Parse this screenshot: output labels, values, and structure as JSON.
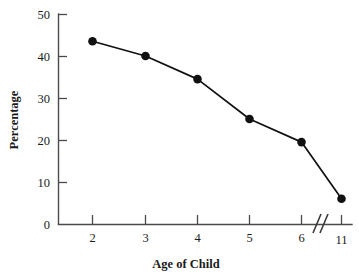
{
  "chart_data": {
    "type": "line",
    "title": "",
    "xlabel": "Age of Child",
    "ylabel": "Percentage",
    "x": [
      2,
      3,
      4,
      5,
      6,
      11
    ],
    "values": [
      43.5,
      40.0,
      34.5,
      25.0,
      19.5,
      6.0
    ],
    "series": [
      {
        "name": "Percentage",
        "values": [
          43.5,
          40.0,
          34.5,
          25.0,
          19.5,
          6.0
        ]
      }
    ],
    "categories": [
      "2",
      "3",
      "4",
      "5",
      "6",
      "11"
    ],
    "x_tick_labels": [
      "2",
      "3",
      "4",
      "5",
      "6",
      "11"
    ],
    "y_tick_labels": [
      "0",
      "10",
      "20",
      "30",
      "40",
      "50"
    ],
    "y_ticks": [
      0,
      10,
      20,
      30,
      40,
      50
    ],
    "ylim": [
      0,
      50
    ],
    "grid": false,
    "legend": false,
    "legend_position": "none",
    "axis_break": {
      "present": true,
      "between": [
        "6",
        "11"
      ],
      "symbol": "double-slash",
      "axis": "x"
    },
    "marker": "filled-circle",
    "line_color": "#111111",
    "marker_color": "#111111",
    "axis_color": "#4a4a4a",
    "background_color": "#ffffff"
  },
  "axes": {
    "y_axis_label": "Percentage",
    "x_axis_label": "Age of Child"
  },
  "ticks": {
    "y": [
      {
        "label": "50",
        "value": 50
      },
      {
        "label": "40",
        "value": 40
      },
      {
        "label": "30",
        "value": 30
      },
      {
        "label": "20",
        "value": 20
      },
      {
        "label": "10",
        "value": 10
      },
      {
        "label": "0",
        "value": 0
      }
    ],
    "x": [
      {
        "label": "2",
        "value": 2
      },
      {
        "label": "3",
        "value": 3
      },
      {
        "label": "4",
        "value": 4
      },
      {
        "label": "5",
        "value": 5
      },
      {
        "label": "6",
        "value": 6
      },
      {
        "label": "11",
        "value": 11
      }
    ]
  }
}
